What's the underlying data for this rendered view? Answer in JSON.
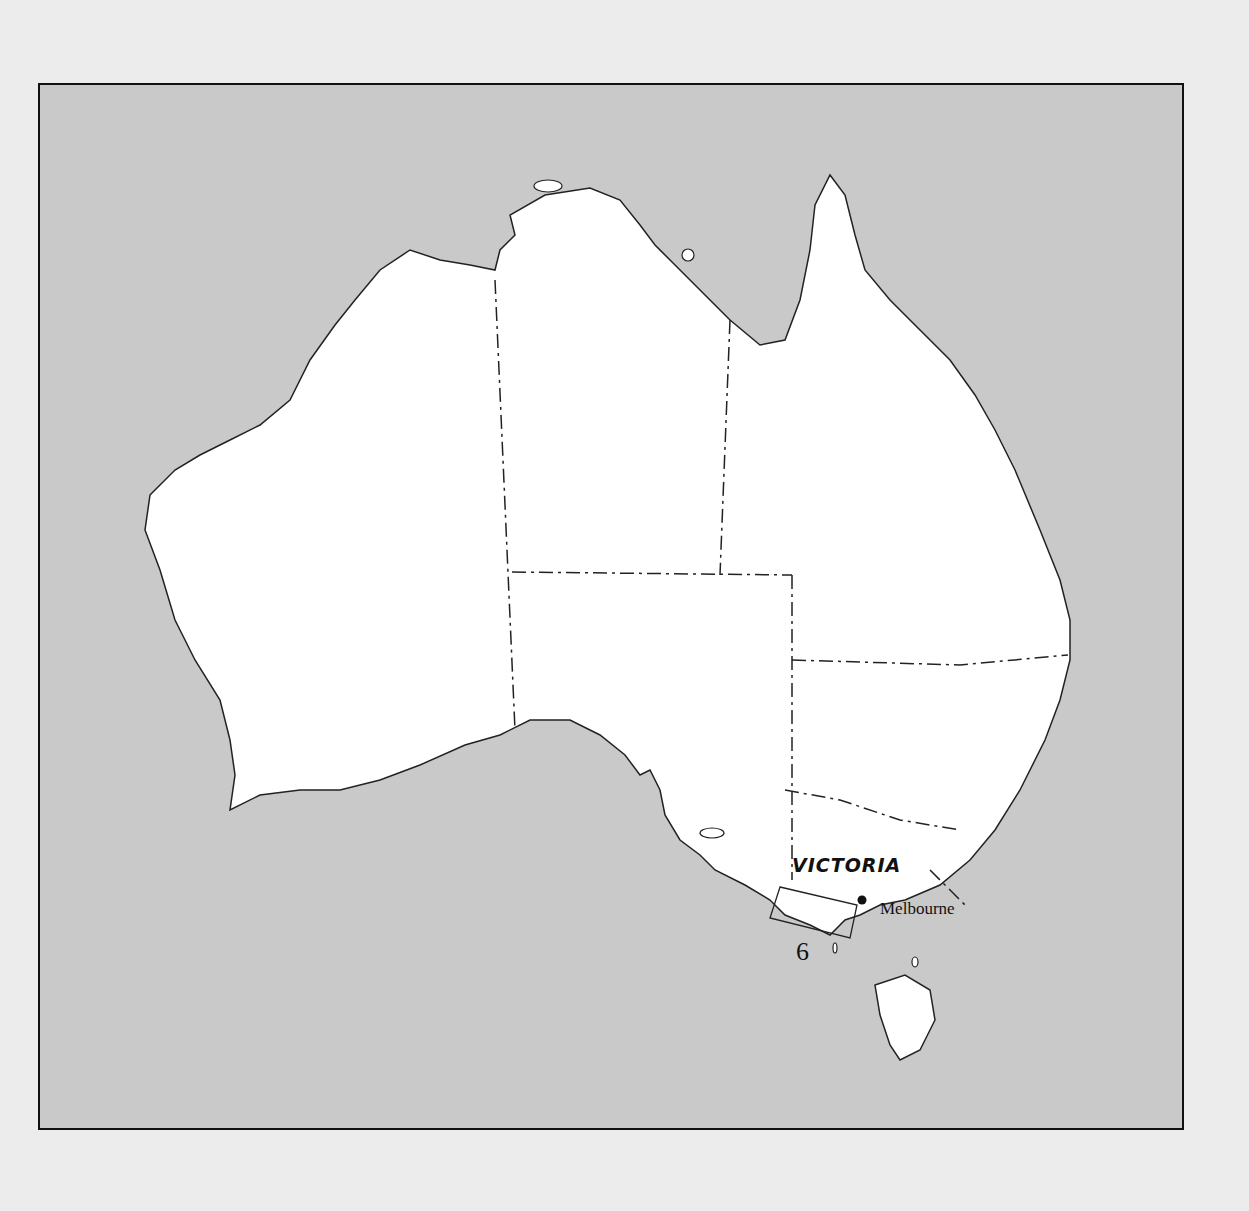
{
  "map": {
    "title": "",
    "region_label": "VICTORIA",
    "city_label": "Melbourne",
    "inset_number": "6",
    "colors": {
      "background": "#c9c9c9",
      "land": "#ffffff",
      "outline": "#222222"
    }
  }
}
